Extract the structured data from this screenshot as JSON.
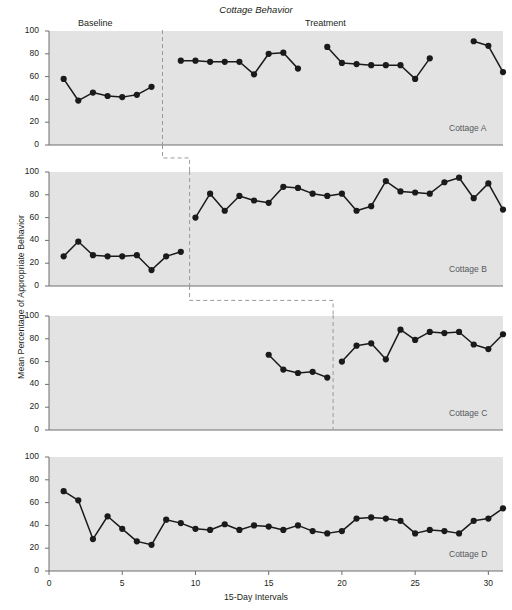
{
  "chart_data": {
    "type": "line",
    "title": "Cottage Behavior",
    "xlabel": "15-Day Intervals",
    "ylabel": "Mean Percentage of Appropriate Behavior",
    "xlim": [
      0,
      31
    ],
    "ylim": [
      0,
      100
    ],
    "xticks": [
      0,
      5,
      10,
      15,
      20,
      25,
      30
    ],
    "yticks": [
      0,
      20,
      40,
      60,
      80,
      100
    ],
    "grid": false,
    "legend": "none",
    "design": "multiple-baseline across participants",
    "phase_labels": [
      "Baseline",
      "Treatment"
    ],
    "panels": [
      {
        "name": "Cottage A",
        "phase_line_x": 7.75,
        "series": [
          {
            "name": "Baseline",
            "x": [
              1,
              2,
              3,
              4,
              5,
              6,
              7
            ],
            "values": [
              58,
              39,
              46,
              43,
              42,
              44,
              51
            ]
          },
          {
            "name": "Treatment-1",
            "x": [
              9,
              10,
              11,
              12,
              13,
              14,
              15,
              16,
              17
            ],
            "values": [
              74,
              74,
              73,
              73,
              73,
              62,
              80,
              81,
              67
            ]
          },
          {
            "name": "Treatment-2",
            "x": [
              19,
              20,
              21,
              22,
              23,
              24,
              25,
              26
            ],
            "values": [
              86,
              72,
              71,
              70,
              70,
              70,
              58,
              76,
              63
            ]
          },
          {
            "name": "Treatment-3",
            "x": [
              29,
              30,
              31
            ],
            "values": [
              91,
              87,
              64
            ]
          }
        ]
      },
      {
        "name": "Cottage B",
        "phase_line_x": 9.6,
        "series": [
          {
            "name": "Baseline",
            "x": [
              1,
              2,
              3,
              4,
              5,
              6,
              7,
              8,
              9
            ],
            "values": [
              26,
              39,
              27,
              26,
              26,
              27,
              14,
              26,
              30
            ]
          },
          {
            "name": "Treatment",
            "x": [
              10,
              11,
              12,
              13,
              14,
              15,
              16,
              17,
              18,
              19,
              20,
              21,
              22,
              23,
              24,
              25,
              26,
              27,
              28,
              29,
              30,
              31
            ],
            "values": [
              60,
              81,
              66,
              79,
              75,
              73,
              87,
              86,
              81,
              79,
              81,
              66,
              70,
              92,
              83,
              82,
              81,
              91,
              95,
              77,
              90,
              67
            ]
          }
        ]
      },
      {
        "name": "Cottage C",
        "phase_line_x": 19.4,
        "series": [
          {
            "name": "Baseline",
            "x": [
              15,
              16,
              17,
              18,
              19
            ],
            "values": [
              66,
              53,
              50,
              51,
              46
            ]
          },
          {
            "name": "Treatment",
            "x": [
              20,
              21,
              22,
              23,
              24,
              25,
              26,
              27,
              28,
              29,
              30,
              31
            ],
            "values": [
              60,
              74,
              76,
              62,
              88,
              79,
              86,
              85,
              86,
              75,
              71,
              84
            ]
          }
        ]
      },
      {
        "name": "Cottage D",
        "phase_line_x": null,
        "series": [
          {
            "name": "Baseline",
            "x": [
              1,
              2,
              3,
              4,
              5,
              6,
              7,
              8,
              9,
              10,
              11,
              12,
              13,
              14,
              15,
              16,
              17,
              18,
              19,
              20,
              21,
              22,
              23,
              24,
              25,
              26,
              27,
              28,
              29,
              30,
              31
            ],
            "values": [
              70,
              62,
              28,
              48,
              37,
              26,
              23,
              45,
              42,
              37,
              36,
              41,
              36,
              40,
              39,
              36,
              40,
              35,
              33,
              35,
              46,
              47,
              46,
              44,
              33,
              36,
              35,
              33,
              44,
              46,
              55
            ]
          }
        ]
      }
    ],
    "connectors": [
      {
        "from_panel": "Cottage A",
        "to_panel": "Cottage B"
      },
      {
        "from_panel": "Cottage B",
        "to_panel": "Cottage C"
      }
    ]
  },
  "style": {
    "plot_background": "#e3e3e3",
    "line_color": "#1a1a1a",
    "marker_color": "#1a1a1a",
    "axis_color": "#6d6e71",
    "phase_line_color": "#9a9a9a",
    "tag_color": "#58595b"
  }
}
